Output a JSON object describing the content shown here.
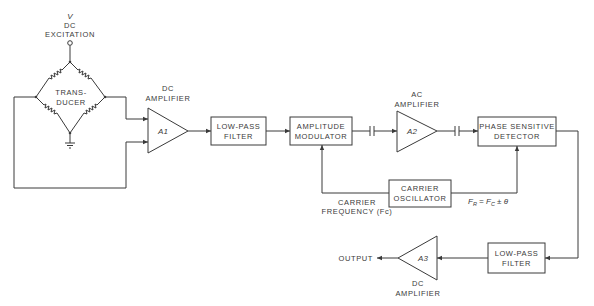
{
  "diagram": {
    "excitation": {
      "symbol": "V",
      "line1": "DC",
      "line2": "EXCITATION"
    },
    "transducer": {
      "line1": "TRANS-",
      "line2": "DUCER"
    },
    "a1": {
      "label": "A1",
      "caption1": "DC",
      "caption2": "AMPLIFIER"
    },
    "lpf1": {
      "line1": "LOW-PASS",
      "line2": "FILTER"
    },
    "modulator": {
      "line1": "AMPLITUDE",
      "line2": "MODULATOR"
    },
    "a2": {
      "label": "A2",
      "caption1": "AC",
      "caption2": "AMPLIFIER"
    },
    "psd": {
      "line1": "PHASE SENSITIVE",
      "line2": "DETECTOR"
    },
    "oscillator": {
      "line1": "CARRIER",
      "line2": "OSCILLATOR"
    },
    "carrier_freq": {
      "line1": "CARRIER",
      "line2": "FREQUENCY (Fc)"
    },
    "formula": {
      "fr": "F",
      "fr_sub": "R",
      "eq": " = ",
      "fc": "F",
      "fc_sub": "C",
      "rest": " ± θ"
    },
    "lpf2": {
      "line1": "LOW-PASS",
      "line2": "FILTER"
    },
    "a3": {
      "label": "A3",
      "caption1": "DC",
      "caption2": "AMPLIFIER"
    },
    "output": {
      "label": "OUTPUT"
    }
  }
}
